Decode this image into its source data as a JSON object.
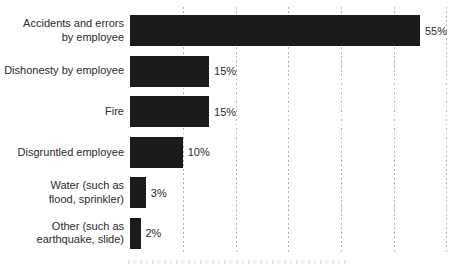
{
  "chart_data": {
    "type": "bar",
    "orientation": "horizontal",
    "title": "",
    "xlabel": "",
    "ylabel": "",
    "xlim": [
      0,
      60
    ],
    "grid": "dotted-vertical",
    "gridline_percents": [
      10,
      20,
      30,
      40,
      50,
      60
    ],
    "categories": [
      "Accidents and errors by employee",
      "Dishonesty by employee",
      "Fire",
      "Disgruntled employee",
      "Water (such as flood, sprinkler)",
      "Other (such as earthquake, slide)"
    ],
    "values": [
      55,
      15,
      15,
      10,
      3,
      2
    ],
    "value_labels": [
      "55%",
      "15%",
      "15%",
      "10%",
      "3%",
      "2%"
    ],
    "legend": null
  },
  "rows": [
    {
      "label_lines": [
        "Accidents and errors",
        "by employee"
      ],
      "value_label": "55%"
    },
    {
      "label_lines": [
        "Dishonesty by employee"
      ],
      "value_label": "15%"
    },
    {
      "label_lines": [
        "Fire"
      ],
      "value_label": "15%"
    },
    {
      "label_lines": [
        "Disgruntled employee"
      ],
      "value_label": "10%"
    },
    {
      "label_lines": [
        "Water (such as",
        "flood, sprinkler)"
      ],
      "value_label": "3%"
    },
    {
      "label_lines": [
        "Other (such as",
        "earthquake, slide)"
      ],
      "value_label": "2%"
    }
  ],
  "colors": {
    "bar": "#1b1b1b",
    "text": "#2b2b2b",
    "gridline": "#b4b4b4",
    "background": "#ffffff"
  }
}
